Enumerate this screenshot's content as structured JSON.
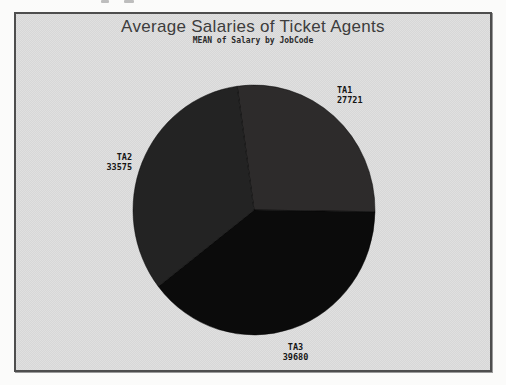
{
  "window": {
    "width": 506,
    "height": 385
  },
  "chart": {
    "title": "Average Salaries of Ticket Agents",
    "subtitle": "MEAN of Salary by JobCode"
  },
  "chart_data": {
    "type": "pie",
    "title": "Average Salaries of Ticket Agents",
    "subtitle": "MEAN of Salary by JobCode",
    "statistic": "MEAN of Salary",
    "group_by": "JobCode",
    "categories": [
      "TA1",
      "TA2",
      "TA3"
    ],
    "values": [
      27721,
      33575,
      39680
    ],
    "value_labels": [
      "27721",
      "33575",
      "39680"
    ],
    "slice_colors": [
      "#2d2b2b",
      "#232323",
      "#0b0b0b"
    ],
    "start_angle_deg": 98,
    "direction": "clockwise",
    "draw_order_clockwise": [
      "TA1",
      "TA3",
      "TA2"
    ],
    "legend": "none",
    "label_style": "category name above value, placed outside slice"
  },
  "colors": {
    "frame_background": "#e0e0e0",
    "frame_border": "#4e4e4e",
    "page_background": "#fbfbfa",
    "title_text": "#3d3d3d",
    "label_text": "#151515"
  }
}
